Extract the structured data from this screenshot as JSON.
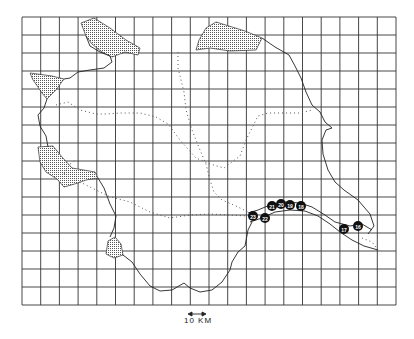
{
  "map": {
    "background": "#ffffff",
    "line_color": "#222222",
    "grid": {
      "x0": 22,
      "y0": 17,
      "x1": 396,
      "y1": 305,
      "cols": 20,
      "rows": 16
    },
    "scale_bar": {
      "label": "10 KM"
    },
    "markers": [
      {
        "id": "16",
        "x": 358,
        "y": 226
      },
      {
        "id": "17",
        "x": 344,
        "y": 229
      },
      {
        "id": "18",
        "x": 301,
        "y": 206
      },
      {
        "id": "19",
        "x": 290,
        "y": 205
      },
      {
        "id": "20",
        "x": 281,
        "y": 204
      },
      {
        "id": "21",
        "x": 272,
        "y": 206
      },
      {
        "id": "22",
        "x": 265,
        "y": 218
      },
      {
        "id": "23",
        "x": 253,
        "y": 216
      }
    ],
    "legend_features": [
      "boundary",
      "stippled-areas",
      "dotted-routes",
      "river",
      "numbered-sites"
    ]
  }
}
